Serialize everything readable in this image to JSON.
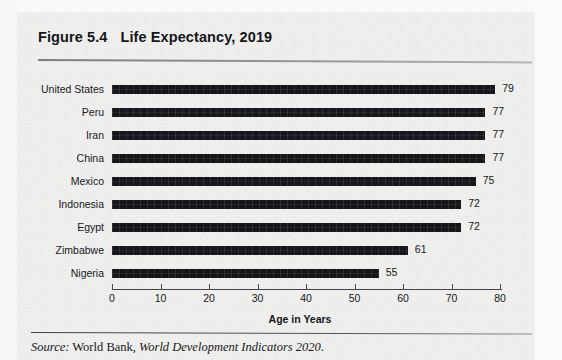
{
  "figure": {
    "number_label": "Figure 5.4",
    "title": "Life Expectancy, 2019"
  },
  "source": {
    "prefix": "Source:",
    "publisher": " World Bank, ",
    "publication": "World Development Indicators 2020",
    "terminator": "."
  },
  "colors": {
    "bar": "#15151a",
    "text": "#17181c",
    "page": "#eeeeec",
    "rule": "#5b5b60"
  },
  "chart_data": {
    "type": "bar",
    "orientation": "horizontal",
    "title": "Life Expectancy, 2019",
    "xlabel": "Age in Years",
    "ylabel": "",
    "xlim": [
      0,
      80
    ],
    "xticks": [
      0,
      10,
      20,
      30,
      40,
      50,
      60,
      70,
      80
    ],
    "xtick_labels": [
      "0",
      "10",
      "20",
      "30",
      "40",
      "50",
      "60",
      "70",
      "80"
    ],
    "grid": false,
    "legend": false,
    "data_labels": true,
    "categories": [
      "United States",
      "Peru",
      "Iran",
      "China",
      "Mexico",
      "Indonesia",
      "Egypt",
      "Zimbabwe",
      "Nigeria"
    ],
    "values": [
      79,
      77,
      77,
      77,
      75,
      72,
      72,
      61,
      55
    ],
    "value_labels": [
      "79",
      "77",
      "77",
      "77",
      "75",
      "72",
      "72",
      "61",
      "55"
    ],
    "units": "years"
  }
}
